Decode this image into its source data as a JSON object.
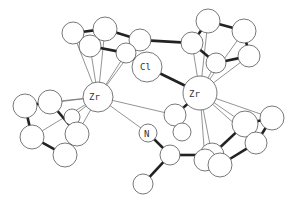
{
  "figure": {
    "type": "molecular-structure-ortep",
    "labels": {
      "zr_left": "Zr",
      "zr_right": "Zr",
      "cl_top": "Cl",
      "cl_hidden": "Cl",
      "n": "N"
    }
  },
  "atoms": [
    {
      "id": "ZrL",
      "x": 98,
      "y": 97,
      "r": 15,
      "label": "Zr"
    },
    {
      "id": "ZrR",
      "x": 200,
      "y": 93,
      "r": 17,
      "label": "Zr"
    },
    {
      "id": "Cl1",
      "x": 147,
      "y": 67,
      "r": 15,
      "label": "Cl"
    },
    {
      "id": "N",
      "x": 148,
      "y": 133,
      "r": 9,
      "label": "N"
    },
    {
      "id": "ClH",
      "x": 72,
      "y": 117,
      "r": 8,
      "label": "Cl"
    },
    {
      "id": "a1",
      "x": 73,
      "y": 33,
      "r": 11
    },
    {
      "id": "a2",
      "x": 105,
      "y": 29,
      "r": 12
    },
    {
      "id": "a3",
      "x": 90,
      "y": 46,
      "r": 11
    },
    {
      "id": "a4",
      "x": 140,
      "y": 40,
      "r": 11
    },
    {
      "id": "a5",
      "x": 126,
      "y": 53,
      "r": 10
    },
    {
      "id": "b1",
      "x": 208,
      "y": 21,
      "r": 12
    },
    {
      "id": "b2",
      "x": 244,
      "y": 31,
      "r": 12
    },
    {
      "id": "b3",
      "x": 192,
      "y": 43,
      "r": 11
    },
    {
      "id": "b4",
      "x": 249,
      "y": 56,
      "r": 11
    },
    {
      "id": "b5",
      "x": 216,
      "y": 63,
      "r": 10
    },
    {
      "id": "c1",
      "x": 25,
      "y": 106,
      "r": 12
    },
    {
      "id": "c2",
      "x": 50,
      "y": 102,
      "r": 12
    },
    {
      "id": "c3",
      "x": 32,
      "y": 137,
      "r": 12
    },
    {
      "id": "c4",
      "x": 77,
      "y": 134,
      "r": 12
    },
    {
      "id": "c5",
      "x": 65,
      "y": 155,
      "r": 12
    },
    {
      "id": "d1",
      "x": 175,
      "y": 115,
      "r": 11
    },
    {
      "id": "d2",
      "x": 182,
      "y": 132,
      "r": 9
    },
    {
      "id": "d3",
      "x": 170,
      "y": 155,
      "r": 10
    },
    {
      "id": "d4",
      "x": 143,
      "y": 184,
      "r": 10
    },
    {
      "id": "e1",
      "x": 245,
      "y": 124,
      "r": 13
    },
    {
      "id": "e2",
      "x": 272,
      "y": 118,
      "r": 12
    },
    {
      "id": "e3",
      "x": 256,
      "y": 143,
      "r": 11
    },
    {
      "id": "e4",
      "x": 212,
      "y": 155,
      "r": 12
    },
    {
      "id": "e5",
      "x": 220,
      "y": 165,
      "r": 12
    },
    {
      "id": "e6",
      "x": 205,
      "y": 160,
      "r": 11
    }
  ],
  "bonds_thick": [
    [
      "a1",
      "a2"
    ],
    [
      "a1",
      "a3"
    ],
    [
      "a2",
      "a4"
    ],
    [
      "a3",
      "a5"
    ],
    [
      "a4",
      "a5"
    ],
    [
      "b1",
      "b2"
    ],
    [
      "b1",
      "b3"
    ],
    [
      "b2",
      "b4"
    ],
    [
      "b3",
      "b5"
    ],
    [
      "b4",
      "b5"
    ],
    [
      "c1",
      "c2"
    ],
    [
      "c1",
      "c3"
    ],
    [
      "c2",
      "c4"
    ],
    [
      "c3",
      "c5"
    ],
    [
      "c4",
      "c5"
    ],
    [
      "Cl1",
      "ZrR"
    ],
    [
      "ZrR",
      "d1"
    ],
    [
      "N",
      "d3"
    ],
    [
      "d1",
      "d2"
    ],
    [
      "d3",
      "d4"
    ],
    [
      "d3",
      "e4"
    ],
    [
      "e1",
      "e2"
    ],
    [
      "e1",
      "e4"
    ],
    [
      "e2",
      "e3"
    ],
    [
      "e3",
      "e5"
    ],
    [
      "e4",
      "e5"
    ],
    [
      "a5",
      "Cl1"
    ],
    [
      "b3",
      "a4"
    ]
  ],
  "bonds_thin": [
    [
      "ZrL",
      "a1"
    ],
    [
      "ZrL",
      "a2"
    ],
    [
      "ZrL",
      "a3"
    ],
    [
      "ZrL",
      "a4"
    ],
    [
      "ZrL",
      "a5"
    ],
    [
      "ZrR",
      "b1"
    ],
    [
      "ZrR",
      "b2"
    ],
    [
      "ZrR",
      "b3"
    ],
    [
      "ZrR",
      "b4"
    ],
    [
      "ZrR",
      "b5"
    ],
    [
      "ZrL",
      "c2"
    ],
    [
      "ZrL",
      "c4"
    ],
    [
      "ZrL",
      "c1"
    ],
    [
      "ZrL",
      "c3"
    ],
    [
      "ZrL",
      "ClH"
    ],
    [
      "ZrL",
      "N"
    ],
    [
      "ZrL",
      "d1"
    ],
    [
      "ZrR",
      "e1"
    ],
    [
      "ZrR",
      "e2"
    ],
    [
      "ZrR",
      "e4"
    ],
    [
      "ZrR",
      "e6"
    ],
    [
      "ZrR",
      "e3"
    ]
  ]
}
